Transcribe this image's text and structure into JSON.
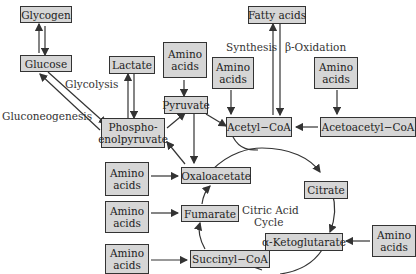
{
  "diagram": {
    "nodes": {
      "glycogen": "Glycogen",
      "glucose": "Glucose",
      "lactate": "Lactate",
      "amino_pyr": "Amino acids",
      "pyruvate": "Pyruvate",
      "pep": "Phospho-enolpyruvate",
      "pep_l1": "Phospho-",
      "pep_l2": "enolpyruvate",
      "fatty_acids": "Fatty acids",
      "amino_acetyl": "Amino acids",
      "acetyl_coa": "Acetyl−CoA",
      "amino_acetoacetyl": "Amino acids",
      "acetoacetyl_coa": "Acetoacetyl−CoA",
      "amino_oxalo": "Amino acids",
      "oxaloacetate": "Oxaloacetate",
      "citrate": "Citrate",
      "amino_fum": "Amino acids",
      "fumarate": "Fumarate",
      "akg": "α-Ketoglutarate",
      "amino_akg": "Amino acids",
      "amino_succ": "Amino acids",
      "succinyl_coa": "Succinyl−CoA"
    },
    "amino_l1": "Amino",
    "amino_l2": "acids",
    "labels": {
      "glycolysis": "Glycolysis",
      "gluconeogenesis": "Gluconeogenesis",
      "synthesis": "Synthesis",
      "beta_oxidation": "β-Oxidation",
      "cycle_l1": "Citric Acid",
      "cycle_l2": "Cycle"
    },
    "colors": {
      "box_fill": "#d6d6d6",
      "stroke": "#333333"
    }
  }
}
